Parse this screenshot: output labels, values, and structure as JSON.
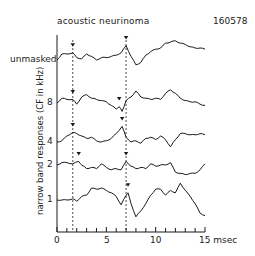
{
  "chart_data": {
    "type": "line",
    "title": "acoustic neurinoma",
    "subtitle": "160578",
    "xlabel": "msec",
    "ylabel": "narrow band responses (CF in kHz)",
    "xlim": [
      0,
      15
    ],
    "xticks": [
      0,
      5,
      10,
      15
    ],
    "xtick_labels": [
      "0",
      "5",
      "10",
      "15 msec"
    ],
    "minor_tick_step": 1,
    "grid": false,
    "legend": null,
    "vertical_markers_msec": [
      1.6,
      7.0
    ],
    "series": [
      {
        "name": "unmasked",
        "label": "unmasked",
        "peak_markers_msec": [
          1.6,
          7.0
        ],
        "x": [
          0,
          0.5,
          1,
          1.6,
          2,
          2.5,
          3,
          3.5,
          4,
          4.5,
          5,
          5.5,
          6,
          6.5,
          7,
          7.5,
          8,
          8.5,
          9,
          9.5,
          10,
          10.5,
          11,
          11.5,
          12,
          12.5,
          13,
          13.5,
          14,
          14.5,
          15
        ],
        "y": [
          0,
          0.5,
          0.5,
          0.6,
          0.2,
          0.1,
          0.5,
          0.3,
          0.0,
          0.2,
          0.2,
          0.3,
          0.4,
          0.6,
          1.2,
          0.3,
          -0.4,
          -0.2,
          0.4,
          0.7,
          0.9,
          1.0,
          1.4,
          1.5,
          1.6,
          1.4,
          1.3,
          1.1,
          1.0,
          1.0,
          0.9
        ]
      },
      {
        "name": "8 kHz",
        "label": "8",
        "peak_markers_msec": [
          1.6,
          6.3
        ],
        "x": [
          0,
          0.5,
          1,
          1.6,
          2,
          2.5,
          3,
          3.5,
          4,
          4.5,
          5,
          5.5,
          6,
          6.3,
          6.6,
          7,
          7.5,
          8,
          8.5,
          9,
          9.5,
          10,
          10.5,
          11,
          11.5,
          12,
          12.5,
          13,
          13.5,
          14,
          14.5,
          15
        ],
        "y": [
          0,
          0.4,
          0.3,
          0.3,
          -0.1,
          0.5,
          0.7,
          0.4,
          0.3,
          0.2,
          0.1,
          -0.2,
          -0.5,
          -0.3,
          -0.7,
          0.2,
          0.5,
          1.0,
          0.5,
          0.4,
          0.3,
          0.4,
          0.3,
          0.8,
          1.1,
          0.8,
          0.4,
          0.2,
          0.1,
          0.1,
          -0.1,
          -0.2
        ]
      },
      {
        "name": "4 kHz",
        "label": "4",
        "peak_markers_msec": [
          1.6,
          6.6
        ],
        "x": [
          0,
          0.5,
          1,
          1.6,
          2,
          2.5,
          3,
          3.5,
          4,
          4.5,
          5,
          5.5,
          6,
          6.6,
          7,
          7.5,
          8,
          8.5,
          9,
          9.5,
          10,
          10.5,
          11,
          11.5,
          12,
          12.5,
          13,
          13.5,
          14,
          14.5,
          15
        ],
        "y": [
          0,
          0.1,
          0.5,
          0.8,
          0.7,
          0.5,
          0.3,
          0.4,
          0.1,
          0.0,
          0.1,
          0.3,
          0.7,
          1.3,
          0.4,
          0.0,
          0.1,
          -0.1,
          0.3,
          0.4,
          0.2,
          0.5,
          0.2,
          -0.4,
          0.2,
          0.7,
          0.7,
          0.6,
          0.6,
          0.7,
          0.6
        ]
      },
      {
        "name": "2 kHz",
        "label": "2",
        "peak_markers_msec": [
          2.2,
          7.0
        ],
        "x": [
          0,
          0.5,
          1,
          1.6,
          2.2,
          2.5,
          3,
          3.5,
          4,
          4.5,
          5,
          5.5,
          6,
          6.5,
          7,
          7.5,
          8,
          8.5,
          9,
          9.5,
          10,
          10.5,
          11,
          11.5,
          12,
          12.5,
          13,
          13.5,
          14,
          14.5,
          15
        ],
        "y": [
          0,
          0.2,
          0.2,
          0.1,
          0.3,
          0.0,
          -0.3,
          -0.2,
          -0.3,
          0.1,
          -0.2,
          -0.4,
          -0.3,
          -0.4,
          0.3,
          -0.1,
          -0.3,
          -0.2,
          -0.3,
          0.1,
          -0.1,
          0.0,
          0.0,
          0.2,
          -0.6,
          -0.7,
          -0.8,
          -0.7,
          -0.7,
          -0.4,
          0.1
        ]
      },
      {
        "name": "1 kHz",
        "label": "1",
        "peak_markers_msec": [
          7.2
        ],
        "x": [
          0,
          0.5,
          1,
          1.6,
          2,
          2.5,
          3,
          3.5,
          4,
          4.5,
          5,
          5.5,
          6,
          6.5,
          7,
          7.2,
          7.5,
          8,
          8.5,
          9,
          9.5,
          10,
          10.5,
          11,
          11.5,
          12,
          12.5,
          13,
          13.5,
          14,
          14.5,
          15
        ],
        "y": [
          0,
          0,
          0,
          0.1,
          -0.1,
          0.3,
          0.4,
          1.0,
          0.9,
          1.0,
          0.8,
          0.6,
          0.3,
          -0.4,
          0.4,
          0.6,
          -0.3,
          -1.4,
          -0.9,
          -0.3,
          0.4,
          0.9,
          0.9,
          0.4,
          0.8,
          0.6,
          1.4,
          0.8,
          0.3,
          -0.3,
          -1.1,
          -1.3
        ]
      }
    ]
  },
  "labels": {
    "title": "acoustic neurinoma",
    "code": "160578",
    "ylabel": "narrow band responses (CF in kHz)",
    "rows": [
      "unmasked",
      "8",
      "4",
      "2",
      "1"
    ],
    "xticks": [
      "0",
      "5",
      "10",
      "15 msec"
    ]
  }
}
